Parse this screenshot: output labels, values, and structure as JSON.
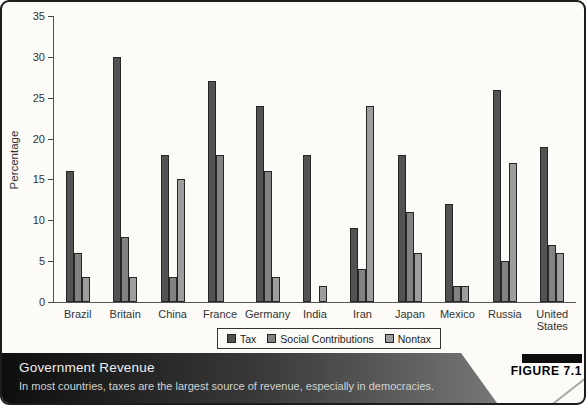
{
  "figure": {
    "label": "FIGURE 7.1"
  },
  "caption": {
    "title": "Government Revenue",
    "subtitle": "In most countries, taxes are the largest source of revenue, especially in democracies."
  },
  "chart_data": {
    "type": "bar",
    "title": "",
    "xlabel": "",
    "ylabel": "Percentage",
    "ylim": [
      0,
      35
    ],
    "ytick_step": 5,
    "grid": false,
    "legend_position": "bottom",
    "categories": [
      "Brazil",
      "Britain",
      "China",
      "France",
      "Germany",
      "India",
      "Iran",
      "Japan",
      "Mexico",
      "Russia",
      "United States"
    ],
    "series": [
      {
        "name": "Tax",
        "color": "#525252",
        "values": [
          16,
          30,
          18,
          27,
          24,
          18,
          9,
          18,
          12,
          26,
          19
        ]
      },
      {
        "name": "Social Contributions",
        "color": "#828282",
        "values": [
          6,
          8,
          3,
          18,
          16,
          null,
          4,
          11,
          2,
          5,
          7
        ]
      },
      {
        "name": "Nontax",
        "color": "#9d9d9d",
        "values": [
          3,
          3,
          15,
          null,
          3,
          2,
          24,
          6,
          2,
          17,
          6
        ]
      }
    ]
  }
}
